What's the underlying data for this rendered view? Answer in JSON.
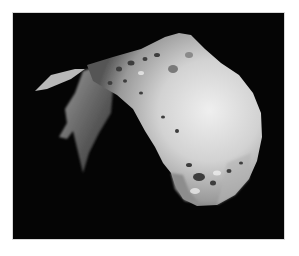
{
  "image": {
    "subject": "asteroid",
    "alt": "Grayscale photograph of an irregular, cratered asteroid against black space",
    "colors": {
      "border": "#ffffff",
      "space": "#050505",
      "surface_light": "#e6e6e6",
      "surface_mid": "#a8a8a8",
      "surface_dark": "#5a5a5a"
    }
  }
}
